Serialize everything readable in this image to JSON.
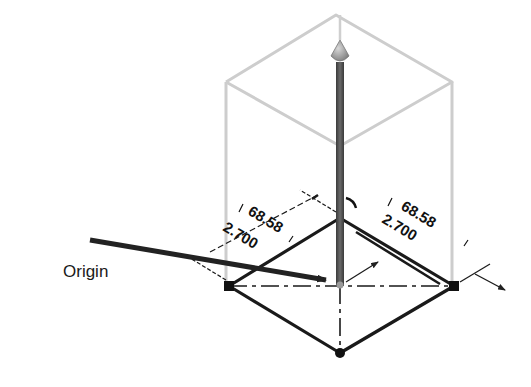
{
  "diagram": {
    "callout": {
      "label": "Origin"
    },
    "dimensions": {
      "left": {
        "primary": "68.58",
        "secondary": "2.700"
      },
      "right": {
        "primary": "68.58",
        "secondary": "2.700"
      }
    },
    "colors": {
      "ghost_box": "#c8c8c8",
      "rod": "#555555",
      "outline": "#1a1a1a",
      "arrow": "#222222"
    }
  }
}
